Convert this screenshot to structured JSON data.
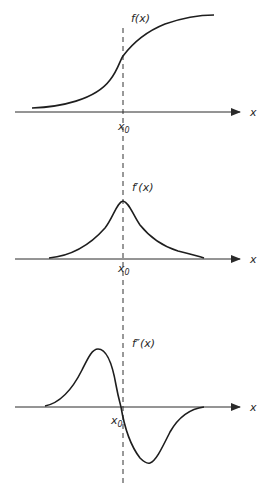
{
  "figure": {
    "panels": [
      {
        "id": "f",
        "label": "f(x)",
        "axis_label": "x",
        "x0_label": "x",
        "x0_sub": "0",
        "shape": "sigmoid (increasing, inflection at x0)"
      },
      {
        "id": "f_prime",
        "label": "f′(x)",
        "axis_label": "x",
        "x0_label": "x",
        "x0_sub": "0",
        "shape": "bell (maximum at x0)"
      },
      {
        "id": "f_double_prime",
        "label": "f″(x)",
        "axis_label": "x",
        "x0_label": "x",
        "x0_sub": "0",
        "shape": "antisymmetric (zero crossing at x0)"
      }
    ],
    "dashed_line": "vertical line through x0 across all panels",
    "colors": {
      "ink": "#1e1e1e",
      "background": "#ffffff"
    }
  }
}
